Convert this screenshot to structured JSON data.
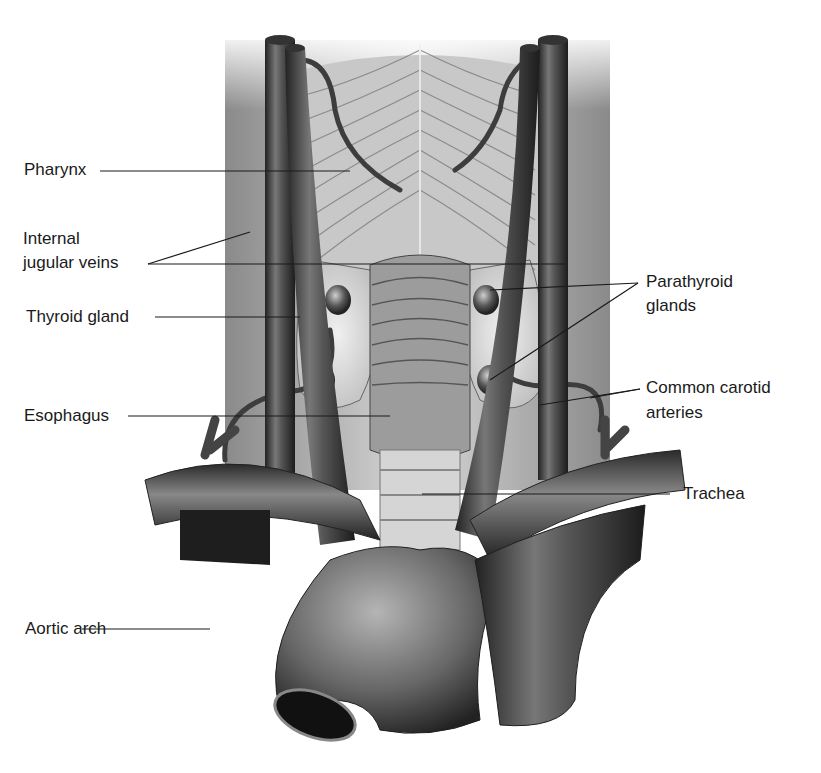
{
  "figure": {
    "colors": {
      "background": "#ffffff",
      "ink": "#1a1a1a",
      "tissue_light": "#d9d9d9",
      "vessel_dark": "#3a3a3a"
    }
  },
  "labels": {
    "left": [
      {
        "id": "pharynx",
        "text": "Pharynx"
      },
      {
        "id": "internal_jugular_1",
        "text": "Internal"
      },
      {
        "id": "internal_jugular_2",
        "text": "jugular veins"
      },
      {
        "id": "thyroid",
        "text": "Thyroid gland"
      },
      {
        "id": "esophagus",
        "text": "Esophagus"
      },
      {
        "id": "aortic_arch",
        "text": "Aortic arch"
      }
    ],
    "right": [
      {
        "id": "parathyroid_1",
        "text": "Parathyroid"
      },
      {
        "id": "parathyroid_2",
        "text": "glands"
      },
      {
        "id": "carotid_1",
        "text": "Common carotid"
      },
      {
        "id": "carotid_2",
        "text": "arteries"
      },
      {
        "id": "trachea",
        "text": "Trachea"
      }
    ]
  }
}
